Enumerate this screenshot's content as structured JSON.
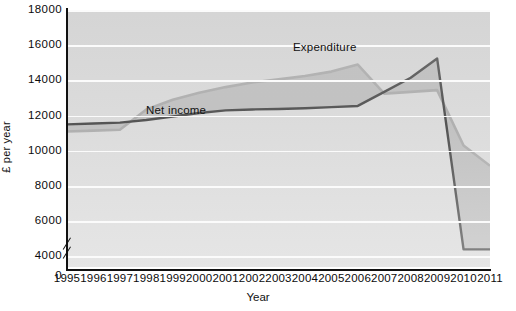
{
  "chart_data": {
    "type": "line",
    "title": "",
    "xlabel": "Year",
    "ylabel": "£ per year",
    "x": [
      1995,
      1996,
      1997,
      1998,
      1999,
      2000,
      2001,
      2002,
      2003,
      2004,
      2005,
      2006,
      2007,
      2008,
      2009,
      2010,
      2011
    ],
    "categories": [
      "1995",
      "1996",
      "1997",
      "1998",
      "1999",
      "2000",
      "2001",
      "2002",
      "2003",
      "2004",
      "2005",
      "2006",
      "2007",
      "2008",
      "2009",
      "2010",
      "2011"
    ],
    "xlim": [
      1995,
      2011
    ],
    "ylim": [
      3400,
      18000
    ],
    "yticks": [
      4000,
      6000,
      8000,
      10000,
      12000,
      14000,
      16000,
      18000
    ],
    "ytick_labels": [
      "4000",
      "6000",
      "8000",
      "10000",
      "12000",
      "14000",
      "16000",
      "18000"
    ],
    "y_origin_label": "0",
    "y_axis_break": true,
    "grid": true,
    "legend": "inline-annotations",
    "series": [
      {
        "name": "Net income",
        "color": "#0d0d0d",
        "values": [
          11500,
          11550,
          11600,
          11750,
          11950,
          12150,
          12300,
          12350,
          12380,
          12420,
          12480,
          12550,
          13350,
          14150,
          15250,
          4400,
          4400
        ]
      },
      {
        "name": "Expenditure",
        "color": "#9a9a9a",
        "values": [
          11100,
          11150,
          11200,
          12350,
          12900,
          13300,
          13620,
          13880,
          14060,
          14250,
          14500,
          14900,
          13250,
          13350,
          13450,
          10300,
          9150
        ]
      }
    ],
    "annotations": [
      {
        "text": "Net income",
        "series": "Net income"
      },
      {
        "text": "Expenditure",
        "series": "Expenditure"
      }
    ],
    "shaded_between_series": true,
    "shade_color": "#a8a8a8"
  }
}
